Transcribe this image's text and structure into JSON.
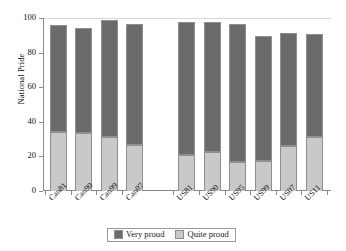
{
  "chart_data": {
    "type": "bar",
    "subtype": "stacked",
    "title": "",
    "xlabel": "",
    "ylabel": "National Pride",
    "ylim": [
      0,
      100
    ],
    "yticks": [
      0,
      20,
      40,
      60,
      80,
      100
    ],
    "grid": false,
    "legend_position": "bottom",
    "categories": [
      "Can81",
      "Can90",
      "Can99",
      "Can07",
      "US81",
      "US90",
      "US95",
      "US99",
      "US07",
      "US11"
    ],
    "series": [
      {
        "name": "Quite proud",
        "color": "#c9c9c9",
        "values": [
          34,
          33.5,
          31.5,
          26.5,
          21,
          22.5,
          17,
          17.5,
          26,
          31
        ]
      },
      {
        "name": "Very proud",
        "color": "#6b6b6b",
        "values": [
          62,
          60.5,
          67.5,
          70,
          76.5,
          75,
          79.5,
          72,
          65.5,
          59.5
        ]
      }
    ],
    "totals": [
      96,
      94,
      99,
      96.5,
      97.5,
      97.5,
      96.5,
      89.5,
      91.5,
      90.5
    ],
    "group_gap_after_index": 3
  },
  "legend": {
    "entries": [
      {
        "label": "Very proud",
        "color": "#6b6b6b"
      },
      {
        "label": "Quite proud",
        "color": "#c9c9c9"
      }
    ]
  },
  "axis": {
    "y_title": "National Pride",
    "y_tick_labels": [
      "100",
      "80",
      "60",
      "40",
      "20",
      "0"
    ]
  }
}
